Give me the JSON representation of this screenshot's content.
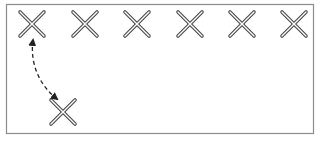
{
  "diagram": {
    "frame": {
      "x": 6.5,
      "y": 4.5,
      "width": 307,
      "height": 129,
      "stroke": "#8c8c8c"
    },
    "marks": [
      {
        "id": "x1",
        "cx": 32,
        "cy": 24
      },
      {
        "id": "x2",
        "cx": 85,
        "cy": 24
      },
      {
        "id": "x3",
        "cx": 137,
        "cy": 24
      },
      {
        "id": "x4",
        "cx": 190,
        "cy": 24
      },
      {
        "id": "x5",
        "cx": 242,
        "cy": 24
      },
      {
        "id": "x6",
        "cx": 294,
        "cy": 24
      },
      {
        "id": "x7",
        "cx": 63,
        "cy": 112
      }
    ],
    "mark_style": {
      "half_size": 12,
      "outer_color": "#4a4a4a",
      "inner_color": "#ffffff",
      "outer_width": 3.6,
      "inner_width": 1.4
    },
    "arrow": {
      "from_mark": "x1",
      "to_mark": "x7",
      "path": "M 33 40 C 30 62, 38 84, 57 99",
      "style": "dashed",
      "bidirectional": true,
      "color": "#222222"
    }
  }
}
